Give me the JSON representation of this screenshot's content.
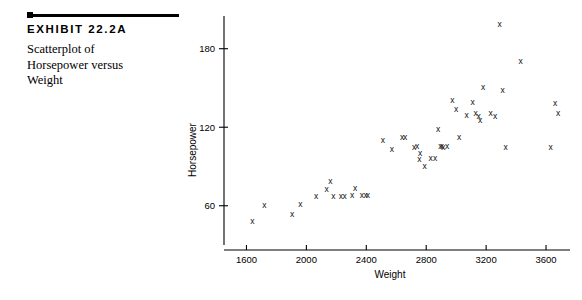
{
  "exhibit": {
    "number_label": "EXHIBIT 22.2A",
    "caption": "Scatterplot of Horsepower versus Weight"
  },
  "chart_data": {
    "type": "scatter",
    "title": "Scatterplot of Horsepower versus Weight",
    "xlabel": "Weight",
    "ylabel": "Horsepower",
    "xlim": [
      1450,
      3760
    ],
    "ylim": [
      30,
      205
    ],
    "xticks": [
      1600,
      2000,
      2400,
      2800,
      3200,
      3600
    ],
    "yticks": [
      60,
      120,
      180
    ],
    "grid": false,
    "legend": null,
    "marker": "x",
    "marker_color": "#111111",
    "series": [
      {
        "name": "Cars",
        "points": [
          [
            1640,
            48
          ],
          [
            1720,
            60
          ],
          [
            1905,
            53
          ],
          [
            1960,
            61
          ],
          [
            2065,
            67
          ],
          [
            2135,
            72
          ],
          [
            2160,
            78
          ],
          [
            2180,
            67
          ],
          [
            2230,
            67
          ],
          [
            2255,
            67
          ],
          [
            2305,
            68
          ],
          [
            2325,
            73
          ],
          [
            2370,
            68
          ],
          [
            2395,
            68
          ],
          [
            2410,
            68
          ],
          [
            2510,
            110
          ],
          [
            2570,
            103
          ],
          [
            2640,
            112
          ],
          [
            2660,
            112
          ],
          [
            2720,
            104
          ],
          [
            2740,
            105
          ],
          [
            2755,
            95
          ],
          [
            2760,
            100
          ],
          [
            2790,
            90
          ],
          [
            2830,
            96
          ],
          [
            2860,
            96
          ],
          [
            2880,
            118
          ],
          [
            2895,
            105
          ],
          [
            2905,
            105
          ],
          [
            2915,
            104
          ],
          [
            2940,
            105
          ],
          [
            2975,
            140
          ],
          [
            3000,
            133
          ],
          [
            3020,
            112
          ],
          [
            3070,
            129
          ],
          [
            3110,
            139
          ],
          [
            3130,
            130
          ],
          [
            3150,
            128
          ],
          [
            3160,
            125
          ],
          [
            3180,
            150
          ],
          [
            3230,
            130
          ],
          [
            3260,
            128
          ],
          [
            3290,
            198
          ],
          [
            3310,
            148
          ],
          [
            3330,
            104
          ],
          [
            3430,
            170
          ],
          [
            3630,
            104
          ],
          [
            3660,
            138
          ],
          [
            3680,
            130
          ]
        ]
      }
    ]
  }
}
